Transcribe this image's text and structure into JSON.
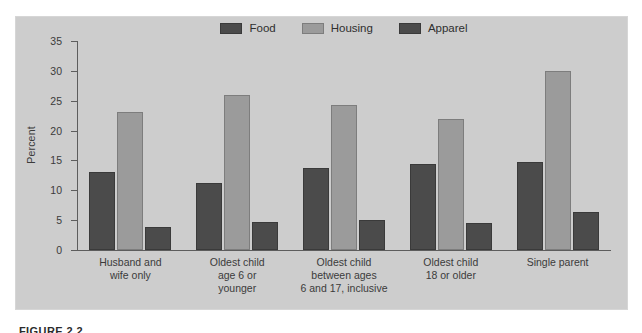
{
  "figure": {
    "caption": "FIGURE 2.2"
  },
  "chart_data": {
    "type": "bar",
    "title": "",
    "xlabel": "",
    "ylabel": "Percent",
    "ylim": [
      0,
      35
    ],
    "yticks": [
      0,
      5,
      10,
      15,
      20,
      25,
      30,
      35
    ],
    "grid": false,
    "legend_position": "top-center",
    "categories": [
      "Husband and\nwife only",
      "Oldest child\nage 6 or\nyounger",
      "Oldest child\nbetween ages\n6 and 17, inclusive",
      "Oldest child\n18 or older",
      "Single parent"
    ],
    "series": [
      {
        "name": "Food",
        "color": "#4b4b4b",
        "values": [
          13.0,
          11.2,
          13.7,
          14.4,
          14.7
        ]
      },
      {
        "name": "Housing",
        "color": "#9b9b9b",
        "values": [
          23.1,
          26.0,
          24.3,
          21.9,
          29.9
        ]
      },
      {
        "name": "Apparel",
        "color": "#4b4b4b",
        "values": [
          3.8,
          4.7,
          5.0,
          4.6,
          6.3
        ]
      }
    ]
  },
  "colors": {
    "panel_background": "#cdcdcd",
    "page_background": "#ffffff",
    "axis": "#5d5d5d",
    "text": "#3b3b3b"
  }
}
